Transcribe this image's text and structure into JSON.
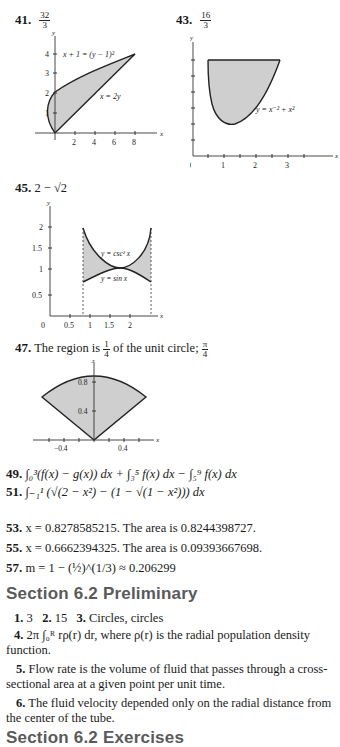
{
  "problems": {
    "p41": {
      "number": "41.",
      "answer_num": "32",
      "answer_den": "3",
      "graph": {
        "curve1_label": "x + 1 = (y − 1)²",
        "curve2_label": "x = 2y",
        "x_ticks": [
          "2",
          "4",
          "6",
          "8"
        ],
        "y_ticks": [
          "1",
          "2",
          "3",
          "4"
        ],
        "x_axis": "x",
        "y_axis": "y"
      }
    },
    "p43": {
      "number": "43.",
      "answer_num": "16",
      "answer_den": "3",
      "graph": {
        "curve_label": "y = x⁻² + x²",
        "x_ticks": [
          "0",
          "1",
          "2",
          "3"
        ],
        "y_ticks": [
          "2",
          "4",
          "6"
        ],
        "x_axis": "x",
        "y_axis": "y"
      }
    },
    "p45": {
      "number": "45.",
      "answer": "2 − √2",
      "graph": {
        "curve1_label": "y = csc² x",
        "curve2_label": "y = sin x",
        "x_ticks": [
          "0",
          "0.5",
          "1",
          "1.5",
          "2"
        ],
        "y_ticks": [
          "0.5",
          "1",
          "1.5",
          "2"
        ],
        "x_axis": "x",
        "y_axis": "y"
      }
    },
    "p47": {
      "number": "47.",
      "answer_prefix": "The region is",
      "answer_frac_num": "1",
      "answer_frac_den": "4",
      "answer_mid": "of the unit circle;",
      "answer_end_num": "π",
      "answer_end_den": "4",
      "graph": {
        "x_ticks": [
          "−0.4",
          "0.4"
        ],
        "y_ticks": [
          "0.4",
          "0.8"
        ],
        "x_axis": "x",
        "y_axis": "y"
      }
    },
    "p49": {
      "number": "49.",
      "answer": "∫₀³(f(x) − g(x)) dx + ∫₃⁵ f(x) dx − ∫₅⁹ f(x) dx"
    },
    "p51": {
      "number": "51.",
      "answer": "∫₋₁¹ (√(2 − x²) − (1 − √(1 − x²))) dx"
    },
    "p53": {
      "number": "53.",
      "answer": "x = 0.8278585215. The area is 0.8244398727."
    },
    "p55": {
      "number": "55.",
      "answer": "x = 0.6662394325. The area is 0.09393667698."
    },
    "p57": {
      "number": "57.",
      "answer": "m = 1 − (½)^(1/3) ≈ 0.206299"
    }
  },
  "section_prelim": {
    "title": "Section 6.2 Preliminary",
    "items": [
      {
        "number": "1.",
        "text": "3"
      },
      {
        "number": "2.",
        "text": "15"
      },
      {
        "number": "3.",
        "text": "Circles, circles"
      },
      {
        "number": "4.",
        "text": "2π ∫₀ᴿ rρ(r) dr, where ρ(r) is the radial population density function."
      },
      {
        "number": "5.",
        "text": "Flow rate is the volume of fluid that passes through a cross-sectional area at a given point per unit time."
      },
      {
        "number": "6.",
        "text": "The fluid velocity depended only on the radial distance from the center of the tube."
      }
    ]
  },
  "section_exercises": {
    "title": "Section 6.2 Exercises"
  }
}
